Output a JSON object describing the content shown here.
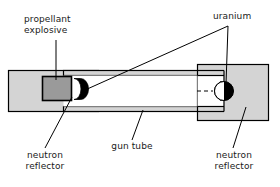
{
  "figure": {
    "type": "technical-diagram",
    "background_color": "#ffffff",
    "line_color": "#000000"
  },
  "labels": {
    "propellant_explosive": "propellant\nexplosive",
    "uranium": "uranium",
    "neutron_reflector_left": "neutron\nreflector",
    "neutron_reflector_right": "neutron\nreflector",
    "gun_tube": "gun tube"
  },
  "parts": [
    {
      "id": "left-reflector-body",
      "name": "neutron reflector (breech block)",
      "fill": "#d4d4d4",
      "stroke": "#000000"
    },
    {
      "id": "propellant-charge",
      "name": "propellant explosive",
      "fill": "#9a9a9a",
      "stroke": "#000000"
    },
    {
      "id": "uranium-projectile",
      "name": "uranium projectile (bullet)",
      "fill": "#000000",
      "stroke": "#000000"
    },
    {
      "id": "gun-tube-barrel",
      "name": "gun tube",
      "fill": "#ffffff",
      "stroke": "#000000"
    },
    {
      "id": "right-reflector-body",
      "name": "neutron reflector (target block)",
      "fill": "#d4d4d4",
      "stroke": "#000000"
    },
    {
      "id": "uranium-target",
      "name": "uranium target",
      "fill": "#000000",
      "stroke": "#000000"
    }
  ],
  "colors": {
    "reflector_gray": "#d4d4d4",
    "propellant_gray": "#9a9a9a",
    "uranium_black": "#000000",
    "tube_white": "#ffffff",
    "outline": "#000000"
  }
}
